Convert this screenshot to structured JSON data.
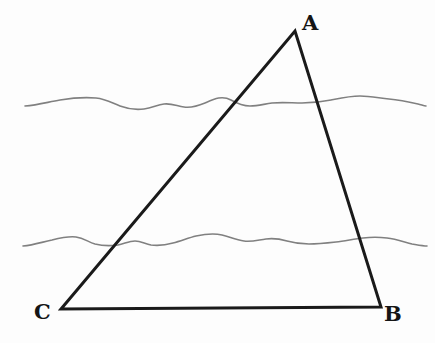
{
  "figure": {
    "kind": "geometry-diagram",
    "background_color": "#fdfdfd",
    "width": 435,
    "height": 343,
    "triangle": {
      "name": "triangle-ABC",
      "stroke_color": "#1a1a1a",
      "stroke_width": 3,
      "fill": "none",
      "vertices": [
        {
          "label": "A",
          "x": 295,
          "y": 31
        },
        {
          "label": "B",
          "x": 381,
          "y": 307
        },
        {
          "label": "C",
          "x": 61,
          "y": 309
        }
      ],
      "edges": [
        {
          "name": "edge-CA",
          "from": "C",
          "to": "A"
        },
        {
          "name": "edge-AB",
          "from": "A",
          "to": "B"
        },
        {
          "name": "edge-CB",
          "from": "C",
          "to": "B"
        }
      ],
      "path": "M 61 309 L 295 31 L 381 307 L 61 309 Z"
    },
    "labels": {
      "a": "A",
      "b": "B",
      "c": "C"
    },
    "wavy_lines": [
      {
        "name": "upper-wavy-line",
        "stroke_color": "#808080",
        "stroke_width": 1.6,
        "x_start": 25,
        "x_end": 426,
        "y_center": 103,
        "path": "M 25 106 C 38 105 48 102 60 100 C 72 98 84 97 96 98 C 106 99 112 103 120 106 C 128 109 136 110 144 109 C 152 108 157 105 164 104 C 171 103 177 106 184 107 C 192 108 198 106 205 103 C 214 99 222 95 231 100 C 238 104 243 106 250 106 C 258 106 264 104 272 103 C 282 102 292 103 302 103 C 312 103 321 102 331 100 C 341 98 350 96 360 96 C 370 96 379 98 389 99 C 399 100 409 102 418 104 C 422 105 424 106 426 106"
      },
      {
        "name": "lower-wavy-line",
        "stroke_color": "#808080",
        "stroke_width": 1.6,
        "x_start": 23,
        "x_end": 427,
        "y_center": 241,
        "path": "M 23 246 C 34 245 42 242 52 240 C 60 238 68 236 76 237 C 84 238 88 242 95 244 C 103 246 110 246 118 245 C 124 244 129 241 135 241 C 141 241 145 244 151 245 C 159 246 166 245 173 243 C 181 241 188 238 196 236 C 205 234 214 233 222 235 C 230 237 236 240 244 241 C 252 242 258 240 266 239 C 273 238 280 239 287 241 C 294 243 301 244 309 244 C 318 244 327 243 336 242 C 345 241 354 239 363 238 C 371 237 379 237 387 238 C 396 239 404 242 412 244 C 418 245 423 246 427 246"
      }
    ]
  }
}
